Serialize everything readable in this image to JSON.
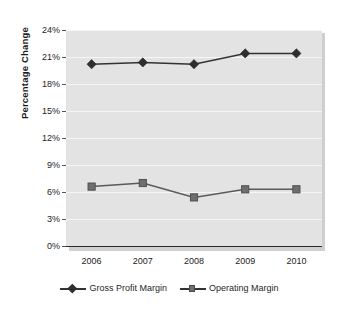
{
  "chart_data": {
    "type": "line",
    "title": "",
    "subtitle": "",
    "xlabel": "",
    "ylabel": "Percentage Change",
    "categories": [
      "2006",
      "2007",
      "2008",
      "2009",
      "2010"
    ],
    "x": [
      2006,
      2007,
      2008,
      2009,
      2010
    ],
    "ylim": [
      0,
      24
    ],
    "ytick_labels": [
      "0%",
      "3%",
      "6%",
      "9%",
      "12%",
      "15%",
      "18%",
      "21%",
      "24%"
    ],
    "ytick_values": [
      0,
      3,
      6,
      9,
      12,
      15,
      18,
      21,
      24
    ],
    "grid": true,
    "grid_axis": "y",
    "legend_position": "bottom",
    "series": [
      {
        "name": "Gross Profit Margin",
        "marker": "diamond",
        "color": "#2e2e2e",
        "line_color": "#333333",
        "values": [
          20.2,
          20.4,
          20.2,
          21.4,
          21.4
        ]
      },
      {
        "name": "Operating Margin",
        "marker": "square",
        "color": "#6e6e6e",
        "line_color": "#5a5a5a",
        "values": [
          6.6,
          7.0,
          5.4,
          6.3,
          6.3
        ]
      }
    ],
    "plot_background": "#e3e3e3",
    "gridline_color": "#f6f6f6",
    "axis_color": "#2b2b2b"
  },
  "axis": {
    "y_title": "Percentage Change"
  },
  "legend": {
    "entries": [
      {
        "label": "Gross Profit Margin",
        "marker": "diamond-marker-icon"
      },
      {
        "label": "Operating Margin",
        "marker": "square-marker-icon"
      }
    ]
  }
}
